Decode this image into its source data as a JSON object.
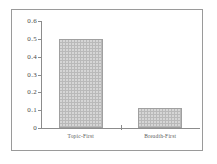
{
  "chart_data": {
    "type": "bar",
    "title": "",
    "subtitle": "",
    "xlabel": "",
    "ylabel": "",
    "categories": [
      "Topic-First",
      "Breadth-First"
    ],
    "values": [
      0.5,
      0.11
    ],
    "ylim": [
      0,
      0.6
    ],
    "yticks": [
      "0",
      "0.1",
      "0.2",
      "0.3",
      "0.4",
      "0.5",
      "0.6"
    ],
    "ytick_values": [
      0,
      0.1,
      0.2,
      0.3,
      0.4,
      0.5,
      0.6
    ],
    "grid": false,
    "legend": null,
    "series": [
      {
        "name": "",
        "values": [
          0.5,
          0.11
        ]
      }
    ],
    "colors": {
      "bar_fill": "#b9b9b9",
      "bar_pattern": "#d8d8d8",
      "bar_outline": "#a0a0a0",
      "axis": "#8c8c8c",
      "frame": "#9a9a9a",
      "text": "#4a4a4a",
      "background": "#ffffff"
    }
  }
}
